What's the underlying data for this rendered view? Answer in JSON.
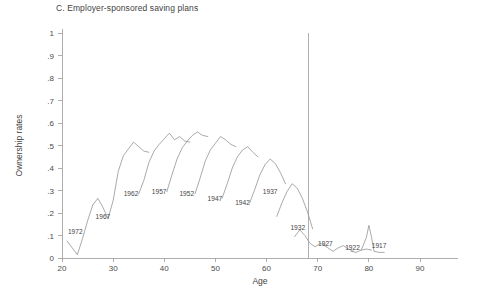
{
  "panel": {
    "title": "C. Employer-sponsored saving plans"
  },
  "axes": {
    "y_title": "Ownership rates",
    "x_title": "Age",
    "y_ticks": [
      "0",
      ".1",
      ".2",
      ".3",
      ".4",
      ".5",
      ".6",
      ".7",
      ".8",
      ".9",
      "1"
    ],
    "x_ticks": [
      "20",
      "30",
      "40",
      "50",
      "60",
      "70",
      "80",
      "90"
    ]
  },
  "chart_data": {
    "type": "line",
    "title": "C. Employer-sponsored saving plans",
    "xlabel": "Age",
    "ylabel": "Ownership rates",
    "xlim": [
      20,
      90
    ],
    "ylim": [
      0,
      1
    ],
    "x_ticks": [
      20,
      30,
      40,
      50,
      60,
      70,
      80,
      90
    ],
    "y_ticks": [
      0,
      0.1,
      0.2,
      0.3,
      0.4,
      0.5,
      0.6,
      0.7,
      0.8,
      0.9,
      1
    ],
    "grid": false,
    "legend": "none",
    "line_color": "#8d8d8d",
    "annotations": [
      {
        "text": "1972",
        "x": 22.6,
        "y": 0.105
      },
      {
        "text": "1967",
        "x": 28.0,
        "y": 0.175
      },
      {
        "text": "1962",
        "x": 33.5,
        "y": 0.275
      },
      {
        "text": "1957",
        "x": 39.0,
        "y": 0.285
      },
      {
        "text": "1952",
        "x": 44.4,
        "y": 0.275
      },
      {
        "text": "1947",
        "x": 49.9,
        "y": 0.255
      },
      {
        "text": "1942",
        "x": 55.3,
        "y": 0.235
      },
      {
        "text": "1937",
        "x": 60.7,
        "y": 0.285
      },
      {
        "text": "1932",
        "x": 66.1,
        "y": 0.125
      },
      {
        "text": "1927",
        "x": 71.5,
        "y": 0.055
      },
      {
        "text": "1922",
        "x": 76.8,
        "y": 0.035
      },
      {
        "text": "1917",
        "x": 82.0,
        "y": 0.045
      }
    ],
    "reference_lines": [
      {
        "orientation": "vertical",
        "x": 68.2,
        "y_from": 0,
        "y_to": 1.0
      }
    ],
    "series": [
      {
        "name": "1972",
        "points": [
          [
            21.0,
            0.075
          ],
          [
            22.0,
            0.045
          ],
          [
            23.0,
            0.015
          ],
          [
            24.0,
            0.085
          ],
          [
            25.0,
            0.165
          ],
          [
            26.0,
            0.235
          ]
        ]
      },
      {
        "name": "1967",
        "points": [
          [
            26.0,
            0.235
          ],
          [
            27.0,
            0.265
          ],
          [
            28.0,
            0.225
          ],
          [
            29.0,
            0.175
          ],
          [
            30.0,
            0.255
          ],
          [
            31.0,
            0.385
          ],
          [
            32.0,
            0.455
          ],
          [
            33.0,
            0.485
          ],
          [
            34.0,
            0.515
          ],
          [
            35.0,
            0.495
          ],
          [
            36.0,
            0.475
          ],
          [
            37.0,
            0.47
          ]
        ]
      },
      {
        "name": "1962",
        "points": [
          [
            35.0,
            0.285
          ],
          [
            36.0,
            0.345
          ],
          [
            37.0,
            0.425
          ],
          [
            38.0,
            0.475
          ],
          [
            39.0,
            0.505
          ],
          [
            40.0,
            0.53
          ],
          [
            41.0,
            0.555
          ],
          [
            42.0,
            0.525
          ],
          [
            43.0,
            0.54
          ],
          [
            44.0,
            0.52
          ],
          [
            45.0,
            0.515
          ]
        ]
      },
      {
        "name": "1957",
        "points": [
          [
            40.5,
            0.295
          ],
          [
            41.5,
            0.37
          ],
          [
            42.5,
            0.44
          ],
          [
            43.5,
            0.49
          ],
          [
            44.5,
            0.52
          ],
          [
            45.5,
            0.545
          ],
          [
            46.5,
            0.56
          ],
          [
            47.5,
            0.545
          ],
          [
            48.5,
            0.54
          ]
        ]
      },
      {
        "name": "1952",
        "points": [
          [
            46.0,
            0.285
          ],
          [
            47.0,
            0.355
          ],
          [
            48.0,
            0.43
          ],
          [
            49.0,
            0.48
          ],
          [
            50.0,
            0.51
          ],
          [
            51.0,
            0.54
          ],
          [
            52.0,
            0.525
          ],
          [
            53.0,
            0.505
          ],
          [
            54.0,
            0.495
          ]
        ]
      },
      {
        "name": "1947",
        "points": [
          [
            51.3,
            0.265
          ],
          [
            52.3,
            0.33
          ],
          [
            53.3,
            0.4
          ],
          [
            54.3,
            0.45
          ],
          [
            55.3,
            0.48
          ],
          [
            56.3,
            0.495
          ],
          [
            57.3,
            0.47
          ],
          [
            58.3,
            0.45
          ]
        ]
      },
      {
        "name": "1942",
        "points": [
          [
            56.7,
            0.245
          ],
          [
            57.7,
            0.305
          ],
          [
            58.7,
            0.37
          ],
          [
            59.7,
            0.415
          ],
          [
            60.7,
            0.44
          ],
          [
            61.7,
            0.42
          ],
          [
            62.7,
            0.38
          ],
          [
            63.7,
            0.33
          ]
        ]
      },
      {
        "name": "1937",
        "points": [
          [
            62.0,
            0.185
          ],
          [
            63.0,
            0.245
          ],
          [
            64.0,
            0.295
          ],
          [
            65.0,
            0.33
          ],
          [
            66.0,
            0.31
          ],
          [
            67.0,
            0.265
          ],
          [
            68.0,
            0.205
          ],
          [
            69.0,
            0.13
          ]
        ]
      },
      {
        "name": "1932",
        "points": [
          [
            65.5,
            0.095
          ],
          [
            66.5,
            0.125
          ],
          [
            67.5,
            0.1
          ],
          [
            68.5,
            0.065
          ],
          [
            69.5,
            0.05
          ],
          [
            70.5,
            0.065
          ],
          [
            71.5,
            0.055
          ]
        ]
      },
      {
        "name": "1927",
        "points": [
          [
            71.0,
            0.06
          ],
          [
            72.0,
            0.045
          ],
          [
            73.0,
            0.03
          ],
          [
            74.0,
            0.045
          ],
          [
            75.0,
            0.055
          ],
          [
            76.0,
            0.04
          ],
          [
            77.0,
            0.03
          ]
        ]
      },
      {
        "name": "1922",
        "points": [
          [
            76.5,
            0.03
          ],
          [
            77.5,
            0.025
          ],
          [
            78.5,
            0.035
          ],
          [
            79.5,
            0.04
          ],
          [
            80.5,
            0.035
          ]
        ]
      },
      {
        "name": "1917",
        "points": [
          [
            78.5,
            0.035
          ],
          [
            79.5,
            0.09
          ],
          [
            80.0,
            0.145
          ],
          [
            80.5,
            0.095
          ],
          [
            81.0,
            0.03
          ],
          [
            82.0,
            0.025
          ],
          [
            83.0,
            0.025
          ]
        ]
      }
    ]
  }
}
